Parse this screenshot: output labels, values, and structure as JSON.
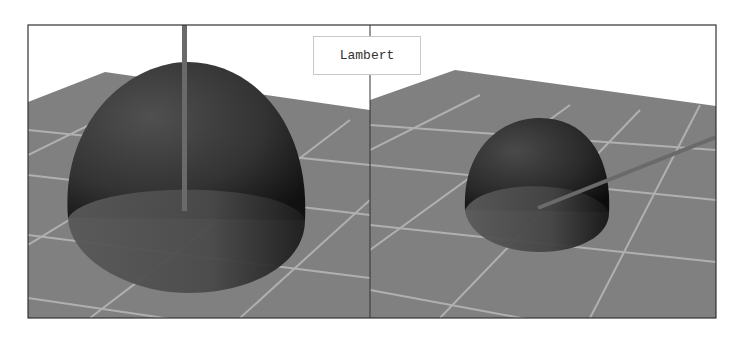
{
  "figure": {
    "label": "Lambert",
    "panels": [
      {
        "name": "left-view",
        "object": "hemisphere",
        "light_direction": "vertical"
      },
      {
        "name": "right-view",
        "object": "hemisphere",
        "light_direction": "oblique"
      }
    ],
    "colors": {
      "background": "#ffffff",
      "floor": "#808080",
      "grid_lines": "#b4b4b4",
      "frame": "#333333",
      "hemisphere_dark": "#1a1a1a",
      "hemisphere_mid": "#4a4a4a",
      "rod": "#6a6a6a"
    }
  }
}
